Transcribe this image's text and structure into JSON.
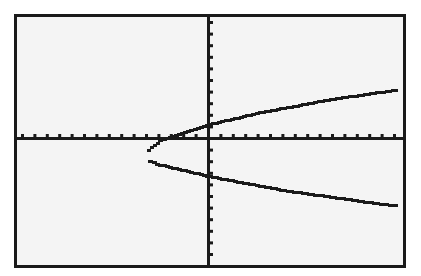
{
  "screen": {
    "title": "Graph of a sideways parabola",
    "background": "#f4f4f4",
    "ink": "#1a1a1a"
  },
  "chart_data": {
    "type": "line",
    "title": "",
    "xlabel": "",
    "ylabel": "",
    "grid": false,
    "legend": "none",
    "axes": {
      "x_origin_px": 208,
      "y_origin_px": 138,
      "x_tick_px": 12.4,
      "y_tick_px": 11.6
    },
    "xlim": [
      -15.4,
      15.9
    ],
    "ylim": [
      -10.7,
      10.4
    ],
    "x_ticks_spacing": 1,
    "y_ticks_spacing": 1,
    "series": [
      {
        "name": "upper branch",
        "points": [
          [
            -4.9,
            -1.0
          ],
          [
            -4.0,
            -0.2
          ],
          [
            -2.0,
            0.5
          ],
          [
            0.0,
            1.2
          ],
          [
            2.0,
            1.7
          ],
          [
            4.0,
            2.2
          ],
          [
            6.0,
            2.6
          ],
          [
            8.0,
            3.0
          ],
          [
            10.0,
            3.4
          ],
          [
            12.0,
            3.7
          ],
          [
            14.0,
            4.0
          ],
          [
            15.2,
            4.2
          ]
        ]
      },
      {
        "name": "lower branch",
        "points": [
          [
            -4.9,
            -1.0
          ],
          [
            -4.8,
            -2.0
          ],
          [
            -4.0,
            -2.3
          ],
          [
            -2.0,
            -2.8
          ],
          [
            0.0,
            -3.3
          ],
          [
            2.0,
            -3.7
          ],
          [
            4.0,
            -4.1
          ],
          [
            6.0,
            -4.5
          ],
          [
            8.0,
            -4.8
          ],
          [
            10.0,
            -5.1
          ],
          [
            12.0,
            -5.4
          ],
          [
            14.0,
            -5.7
          ],
          [
            15.2,
            -5.8
          ]
        ]
      }
    ],
    "vertex": [
      -4.9,
      -1.0
    ]
  }
}
